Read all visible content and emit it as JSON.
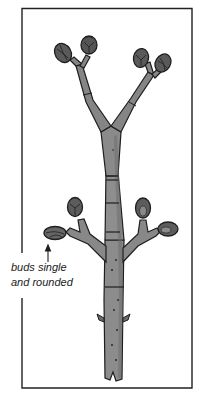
{
  "figure": {
    "colors": {
      "frame": "#222222",
      "stem_fill": "#8c8c8c",
      "stem_shade": "#6e6e6e",
      "bud_fill": "#5a5a5a",
      "bud_highlight": "#8a8a8a",
      "outline": "#1e1e1e",
      "background": "#ffffff"
    }
  },
  "annotation": {
    "line1": "buds single",
    "line2": "and rounded",
    "arrow_direction": "up"
  }
}
